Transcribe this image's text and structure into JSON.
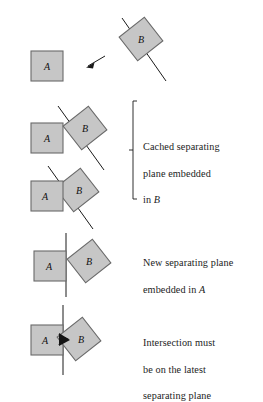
{
  "figure": {
    "colors": {
      "box_fill": "#c6c6c6",
      "box_fill_dark": "#b6b6b6",
      "box_stroke": "#5a5a5a",
      "plane_stroke": "#1a1a1a",
      "intersection_fill": "#111111",
      "background": "#ffffff",
      "text": "#1c1c1c"
    },
    "labels": {
      "box_a": "A",
      "box_b": "B"
    },
    "panels": [
      {
        "id": "panel-approach",
        "index": 1,
        "box_a_label": "A",
        "box_b_label": "B",
        "plane_type": "diagonal",
        "has_arrow": true,
        "arrow_direction": "down-left",
        "intersecting": false,
        "caption": ""
      },
      {
        "id": "panel-cached-separated",
        "index": 2,
        "box_a_label": "A",
        "box_b_label": "B",
        "plane_type": "diagonal",
        "has_arrow": false,
        "intersecting": false,
        "caption": "Cached separating plane embedded in B"
      },
      {
        "id": "panel-cached-touching",
        "index": 3,
        "box_a_label": "A",
        "box_b_label": "B",
        "plane_type": "diagonal",
        "has_arrow": false,
        "intersecting": true,
        "caption": "Cached separating plane embedded in B"
      },
      {
        "id": "panel-new-plane",
        "index": 4,
        "box_a_label": "A",
        "box_b_label": "B",
        "plane_type": "vertical",
        "has_arrow": false,
        "intersecting": false,
        "caption": "New separating plane embedded in A"
      },
      {
        "id": "panel-intersection",
        "index": 5,
        "box_a_label": "A",
        "box_b_label": "B",
        "plane_type": "vertical",
        "has_arrow": false,
        "intersecting": true,
        "caption": "Intersection must be on the latest separating plane"
      }
    ],
    "captions": {
      "cached": {
        "line1": "Cached separating",
        "line2": "plane embedded",
        "line3_prefix": "in ",
        "line3_em": "B"
      },
      "new_plane": {
        "line1": "New separating plane",
        "line2_prefix": "embedded in ",
        "line2_em": "A"
      },
      "intersection": {
        "line1": "Intersection must",
        "line2": "be on the latest",
        "line3": "separating plane"
      }
    },
    "brace": {
      "name": "grouping-brace",
      "spans_panels": [
        2,
        3
      ]
    }
  }
}
